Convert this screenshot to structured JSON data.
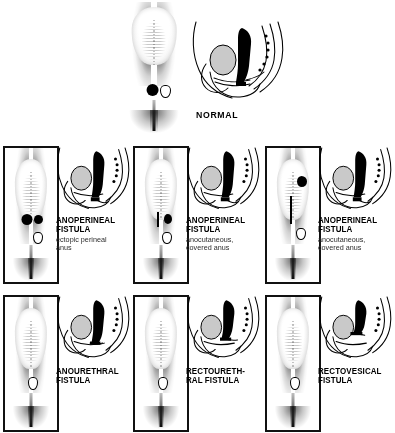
{
  "figure": {
    "style": "black-and-white medical line illustration"
  },
  "legend": {
    "sagittal_parts": [
      "sacrum-with-vertebral-dots",
      "bladder-shaded",
      "rectum-filled-black",
      "urethra",
      "levator-muscle-line",
      "fistula-tract"
    ]
  },
  "normal": {
    "label": "NORMAL",
    "plate": "normal-perineum",
    "sagittal": "normal-sagittal"
  },
  "panels": [
    {
      "id": "anoperineal-ectopic",
      "title": "ANOPERINEAL\nFISTULA",
      "subtitle": "ectopic perineal\nanus",
      "marker": "dark-ectopic-anus-with-black-ribbon",
      "row": 1,
      "column": 1
    },
    {
      "id": "anoperineal-anocutaneous-1",
      "title": "ANOPERINEAL\nFISTULA",
      "subtitle": "anocutaneous,\ncovered anus",
      "marker": "vertical-slit-with-black-ribbon",
      "row": 1,
      "column": 2
    },
    {
      "id": "anoperineal-anocutaneous-2",
      "title": "ANOPERINEAL\nFISTULA",
      "subtitle": "anocutaneous,\ncovered anus",
      "marker": "high-black-patch-with-long-midline-slit",
      "row": 1,
      "column": 3
    },
    {
      "id": "anourethral",
      "title": "ANOURETHRAL\nFISTULA",
      "subtitle": "",
      "marker": "absent-anus-probe-only",
      "row": 2,
      "column": 1
    },
    {
      "id": "rectourethral",
      "title": "RECTOURETH-\nRAL FISTULA",
      "subtitle": "",
      "marker": "absent-anus-probe-only",
      "row": 2,
      "column": 2
    },
    {
      "id": "rectovesical",
      "title": "RECTOVESICAL\nFISTULA",
      "subtitle": "",
      "marker": "absent-anus-probe-only",
      "row": 2,
      "column": 3
    }
  ],
  "colors": {
    "ink": "#000000",
    "background": "#ffffff",
    "bladder_shade": "#c9c9c9",
    "caption_subtitle": "#2b2b2b"
  }
}
